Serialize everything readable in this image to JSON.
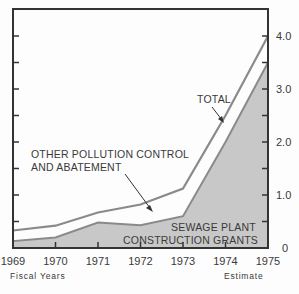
{
  "chart_data": {
    "type": "area",
    "title": "",
    "xlabel": "Fiscal Years",
    "x_note": "Estimate",
    "ylabel": "",
    "categories": [
      "1969",
      "1970",
      "1971",
      "1972",
      "1973",
      "1974",
      "1975"
    ],
    "ylim": [
      0,
      4.0
    ],
    "yticks": [
      "0",
      "1.0",
      "2.0",
      "3.0",
      "4.0"
    ],
    "series": [
      {
        "name": "SEWAGE PLANT CONSTRUCTION GRANTS",
        "values": [
          0.13,
          0.2,
          0.48,
          0.43,
          0.6,
          2.0,
          3.5
        ],
        "fill": "#c8c8c8"
      },
      {
        "name": "OTHER POLLUTION CONTROL AND ABATEMENT",
        "values": [
          0.2,
          0.22,
          0.19,
          0.39,
          0.52,
          0.5,
          0.5
        ]
      },
      {
        "name": "TOTAL",
        "values": [
          0.33,
          0.42,
          0.67,
          0.82,
          1.12,
          2.5,
          4.0
        ]
      }
    ],
    "annotations": [
      "TOTAL",
      "OTHER POLLUTION CONTROL",
      "AND ABATEMENT",
      "SEWAGE PLANT",
      "CONSTRUCTION GRANTS"
    ],
    "grid": false,
    "legend_position": "inline labels"
  },
  "labels": {
    "total": "TOTAL",
    "other_line1": "OTHER POLLUTION CONTROL",
    "other_line2": "AND ABATEMENT",
    "sewage_line1": "SEWAGE PLANT",
    "sewage_line2": "CONSTRUCTION GRANTS",
    "fiscal_years": "Fiscal Years",
    "estimate": "Estimate"
  },
  "colors": {
    "axis": "#333333",
    "line": "#8a8a8a",
    "fill": "#c8c8c8"
  }
}
